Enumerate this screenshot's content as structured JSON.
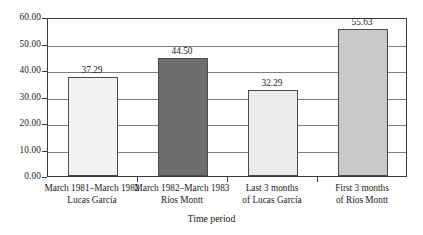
{
  "chart_data": {
    "type": "bar",
    "title": "",
    "xlabel": "Time period",
    "ylabel": "",
    "ylim": [
      0,
      60
    ],
    "grid": true,
    "legend": "none",
    "categories": [
      "March 1981–March 1982 Lucas García",
      "March 1982–March 1983 Ríos Montt",
      "Last 3 months of Lucas García",
      "First 3 months of Ríos Montt"
    ],
    "category_lines": [
      [
        "March 1981–March 1982",
        "Lucas García"
      ],
      [
        "March 1982–March 1983",
        "Ríos Montt"
      ],
      [
        "Last 3 months",
        "of Lucas García"
      ],
      [
        "First 3 months",
        "of Ríos Montt"
      ]
    ],
    "values": [
      37.29,
      44.5,
      32.29,
      55.63
    ],
    "value_labels": [
      "37.29",
      "44.50",
      "32.29",
      "55.63"
    ],
    "bar_colors": [
      "#f2f2f0",
      "#6e6e6e",
      "#ebebe9",
      "#c9c9c7"
    ],
    "bar_border_color": "#4a4a4a",
    "yticks": [
      0,
      10,
      20,
      30,
      40,
      50,
      60
    ],
    "ytick_labels": [
      "0.00",
      "10.00",
      "20.00",
      "30.00",
      "40.00",
      "50.00",
      "60.00"
    ]
  },
  "axis_title": {
    "x": "Time period"
  }
}
